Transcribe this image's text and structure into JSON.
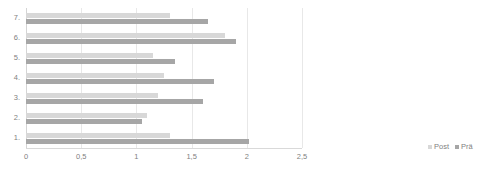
{
  "chart_data": {
    "type": "bar",
    "orientation": "horizontal",
    "title": "",
    "subtitle": "",
    "xlabel": "",
    "ylabel": "",
    "xlim": [
      0,
      2.5
    ],
    "xticks": [
      0,
      0.5,
      1,
      1.5,
      2,
      2.5
    ],
    "xtick_labels": [
      "0",
      "0,5",
      "1",
      "1,5",
      "2",
      "2,5"
    ],
    "categories": [
      "1.",
      "2.",
      "3.",
      "4.",
      "5.",
      "6.",
      "7."
    ],
    "grid": true,
    "grid_axis": "x",
    "legend_position": "bottom-right",
    "series": [
      {
        "name": "Post",
        "color": "#d8d8d8",
        "values": [
          1.3,
          1.1,
          1.2,
          1.25,
          1.15,
          1.8,
          1.3
        ]
      },
      {
        "name": "Prä",
        "color": "#a6a6a6",
        "values": [
          2.02,
          1.05,
          1.6,
          1.7,
          1.35,
          1.9,
          1.65
        ]
      }
    ]
  },
  "legend": {
    "items": [
      {
        "label": "Post",
        "color": "#d8d8d8"
      },
      {
        "label": "Prä",
        "color": "#a6a6a6"
      }
    ]
  },
  "axis": {
    "x_tick_labels": [
      "0",
      "0,5",
      "1",
      "1,5",
      "2",
      "2,5"
    ],
    "y_tick_labels": [
      "7.",
      "6.",
      "5.",
      "4.",
      "3.",
      "2.",
      "1."
    ]
  }
}
